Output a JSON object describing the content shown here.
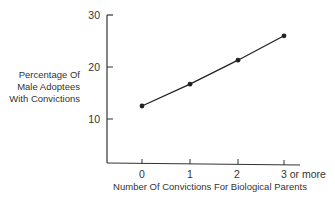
{
  "chart_data": {
    "type": "line",
    "title": "",
    "xlabel": "Number Of Convictions For Biological Parents",
    "ylabel": [
      "Percentage Of",
      "Male Adoptees",
      "With Convictions"
    ],
    "categories": [
      "0",
      "1",
      "2",
      "3 or more"
    ],
    "series": [
      {
        "name": "Male adoptees with convictions (%)",
        "values": [
          12.5,
          16.7,
          21.3,
          26.0
        ]
      }
    ],
    "y_ticks": [
      "10",
      "20",
      "30"
    ],
    "ylim": [
      0,
      30
    ],
    "grid": false,
    "legend": "none",
    "line_color": "#222222"
  }
}
